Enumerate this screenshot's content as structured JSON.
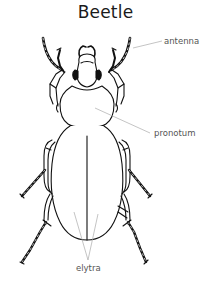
{
  "diagram": {
    "title": "Beetle",
    "labels": [
      {
        "id": "antenna",
        "text": "antenna"
      },
      {
        "id": "pronotum",
        "text": "pronotum"
      },
      {
        "id": "elytra",
        "text": "elytra"
      }
    ],
    "colors": {
      "outline": "#111111",
      "leader_line": "#aaaaaa",
      "label_text": "#555555",
      "background": "#ffffff"
    }
  }
}
